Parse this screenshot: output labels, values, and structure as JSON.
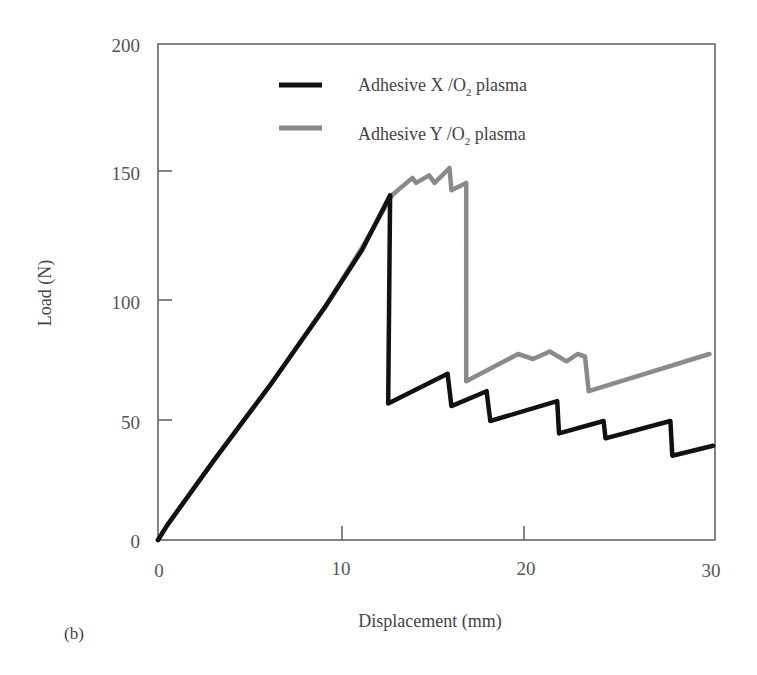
{
  "chart_data": {
    "type": "line",
    "title": "",
    "panel_label": "(b)",
    "xlabel": "Displacement (mm)",
    "ylabel": "Load (N)",
    "xlim": [
      0,
      30
    ],
    "ylim": [
      0,
      200
    ],
    "xticks": [
      0,
      10,
      20,
      30
    ],
    "yticks": [
      0,
      50,
      100,
      150,
      200
    ],
    "grid": false,
    "legend_position": "upper center (inside)",
    "series": [
      {
        "name": "Adhesive X /O₂ plasma",
        "color": "#111111",
        "points": [
          [
            0,
            0
          ],
          [
            0.5,
            6
          ],
          [
            3,
            32
          ],
          [
            6,
            62
          ],
          [
            9,
            94
          ],
          [
            11,
            117
          ],
          [
            12.5,
            139
          ],
          [
            12.4,
            55
          ],
          [
            15.6,
            67
          ],
          [
            15.8,
            54
          ],
          [
            17.7,
            60
          ],
          [
            17.9,
            48
          ],
          [
            21.5,
            56
          ],
          [
            21.6,
            43
          ],
          [
            24.0,
            48
          ],
          [
            24.1,
            41
          ],
          [
            27.6,
            48
          ],
          [
            27.7,
            34
          ],
          [
            29.9,
            38
          ]
        ]
      },
      {
        "name": "Adhesive Y /O₂ plasma",
        "color": "#8a8a8a",
        "points": [
          [
            0,
            0
          ],
          [
            0.5,
            6
          ],
          [
            3,
            32
          ],
          [
            6,
            62
          ],
          [
            9,
            94
          ],
          [
            11,
            118
          ],
          [
            12.6,
            139
          ],
          [
            13.7,
            146
          ],
          [
            13.9,
            144
          ],
          [
            14.6,
            147
          ],
          [
            14.9,
            144
          ],
          [
            15.7,
            150
          ],
          [
            15.8,
            141
          ],
          [
            16.6,
            144
          ],
          [
            16.6,
            64
          ],
          [
            19.4,
            75
          ],
          [
            20.2,
            73
          ],
          [
            21.1,
            76
          ],
          [
            22.0,
            72
          ],
          [
            22.6,
            75
          ],
          [
            23.0,
            74
          ],
          [
            23.2,
            60
          ],
          [
            29.7,
            75
          ]
        ]
      }
    ]
  },
  "labels": {
    "y_title": "Load (N)",
    "x_title": "Displacement (mm)",
    "panel": "(b)",
    "legend": [
      {
        "prefix": "Adhesive X /O",
        "sub": "2",
        "suffix": " plasma"
      },
      {
        "prefix": "Adhesive Y /O",
        "sub": "2",
        "suffix": " plasma"
      }
    ],
    "yticks": [
      "0",
      "50",
      "100",
      "150",
      "200"
    ],
    "xticks": [
      "0",
      "10",
      "20",
      "30"
    ]
  }
}
